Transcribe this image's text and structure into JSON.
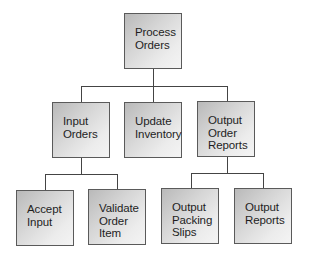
{
  "diagram": {
    "type": "hierarchy-chart",
    "root": {
      "id": "process-orders",
      "lines": [
        "Process",
        "Orders"
      ]
    },
    "level1": [
      {
        "id": "input-orders",
        "lines": [
          "Input",
          "Orders"
        ]
      },
      {
        "id": "update-inventory",
        "lines": [
          "Update",
          "Inventory"
        ]
      },
      {
        "id": "output-order-reports",
        "lines": [
          "Output",
          "Order",
          "Reports"
        ]
      }
    ],
    "level2": [
      {
        "id": "accept-input",
        "parent": "input-orders",
        "lines": [
          "Accept",
          "Input"
        ]
      },
      {
        "id": "validate-order-item",
        "parent": "input-orders",
        "lines": [
          "Validate",
          "Order",
          "Item"
        ]
      },
      {
        "id": "output-packing-slips",
        "parent": "output-order-reports",
        "lines": [
          "Output",
          "Packing",
          "Slips"
        ]
      },
      {
        "id": "output-reports",
        "parent": "output-order-reports",
        "lines": [
          "Output",
          "Reports"
        ]
      }
    ],
    "colors": {
      "node_border": "#5a5a5a",
      "node_fill_dark": "#b9b9b9",
      "node_fill_light": "#f4f4f4",
      "connector": "#444444",
      "text": "#1e1e1e",
      "background": "#ffffff"
    }
  }
}
